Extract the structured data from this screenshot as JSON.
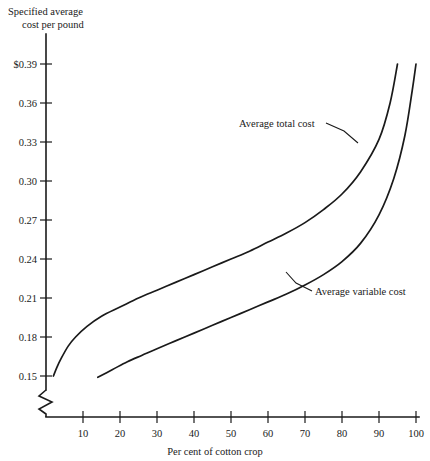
{
  "chart_data": {
    "type": "line",
    "title": "",
    "xlabel": "Per cent of cotton crop",
    "ylabel": "Specified average cost per pound",
    "ylabel_line1": "Specified average",
    "ylabel_line2": "cost per pound",
    "xlim": [
      0,
      100
    ],
    "ylim": [
      0.15,
      0.39
    ],
    "grid": false,
    "axis_break_y": true,
    "axis_break_x": false,
    "legend_position": "inline-annotations",
    "x_ticks": [
      10,
      20,
      30,
      40,
      50,
      60,
      70,
      80,
      90,
      100
    ],
    "x_tick_labels": [
      "10",
      "20",
      "30",
      "40",
      "50",
      "60",
      "70",
      "80",
      "90",
      "100"
    ],
    "y_ticks": [
      0.15,
      0.18,
      0.21,
      0.24,
      0.27,
      0.3,
      0.33,
      0.36,
      0.39
    ],
    "y_tick_labels": [
      "0.15",
      "0.18",
      "0.21",
      "0.24",
      "0.27",
      "0.30",
      "0.33",
      "0.36",
      "$0.39"
    ],
    "series": [
      {
        "name": "Average total cost",
        "annotation": "Average total cost",
        "x": [
          2,
          3,
          4,
          6,
          8,
          11,
          15,
          20,
          25,
          30,
          35,
          40,
          45,
          50,
          55,
          60,
          65,
          70,
          75,
          80,
          85,
          90,
          93,
          95
        ],
        "values": [
          0.15,
          0.157,
          0.163,
          0.173,
          0.18,
          0.188,
          0.196,
          0.203,
          0.21,
          0.216,
          0.222,
          0.228,
          0.234,
          0.24,
          0.246,
          0.253,
          0.26,
          0.268,
          0.278,
          0.29,
          0.307,
          0.332,
          0.36,
          0.39
        ]
      },
      {
        "name": "Average variable cost",
        "annotation": "Average variable cost",
        "x": [
          14,
          18,
          22,
          26,
          30,
          35,
          40,
          45,
          50,
          55,
          60,
          65,
          70,
          75,
          80,
          85,
          90,
          94,
          97,
          99,
          100
        ],
        "values": [
          0.149,
          0.155,
          0.161,
          0.166,
          0.171,
          0.177,
          0.183,
          0.189,
          0.195,
          0.201,
          0.207,
          0.213,
          0.22,
          0.228,
          0.238,
          0.252,
          0.274,
          0.302,
          0.335,
          0.37,
          0.39
        ]
      }
    ],
    "colors": {
      "curve": "#1a1a1a",
      "axis": "#1a1a1a",
      "background": "#ffffff"
    }
  }
}
